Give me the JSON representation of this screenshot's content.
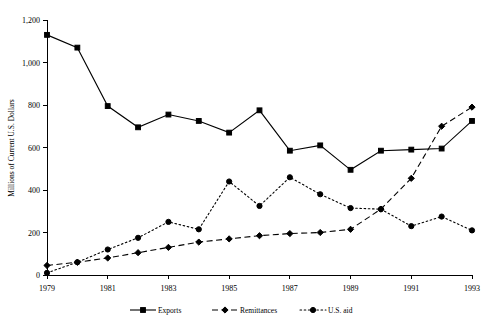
{
  "chart_data": {
    "type": "line",
    "title": "",
    "xlabel": "",
    "ylabel": "Millions of Current U.S. Dollars",
    "x": [
      1979,
      1980,
      1981,
      1982,
      1983,
      1984,
      1985,
      1986,
      1987,
      1988,
      1989,
      1990,
      1991,
      1992,
      1993
    ],
    "xtick_labels": [
      "1979",
      "1981",
      "1983",
      "1985",
      "1987",
      "1989",
      "1991",
      "1993"
    ],
    "xtick_values": [
      1979,
      1981,
      1983,
      1985,
      1987,
      1989,
      1991,
      1993
    ],
    "ytick_labels": [
      "0",
      "200",
      "400",
      "600",
      "800",
      "1,000",
      "1,200"
    ],
    "ytick_values": [
      0,
      200,
      400,
      600,
      800,
      1000,
      1200
    ],
    "xlim": [
      1979,
      1993
    ],
    "ylim": [
      0,
      1200
    ],
    "grid": false,
    "legend_position": "bottom",
    "series": [
      {
        "name": "Exports",
        "line_style": "solid",
        "marker": "square",
        "color": "#000000",
        "values": [
          1130,
          1070,
          795,
          695,
          755,
          725,
          670,
          775,
          585,
          610,
          495,
          585,
          590,
          595,
          725
        ]
      },
      {
        "name": "Remittances",
        "line_style": "dashed",
        "marker": "diamond",
        "color": "#000000",
        "values": [
          45,
          60,
          80,
          105,
          130,
          155,
          170,
          185,
          195,
          200,
          215,
          310,
          455,
          700,
          790
        ]
      },
      {
        "name": "U.S. aid",
        "line_style": "dotted",
        "marker": "circle",
        "color": "#000000",
        "values": [
          10,
          60,
          120,
          175,
          250,
          215,
          440,
          325,
          460,
          380,
          315,
          310,
          230,
          275,
          210
        ]
      }
    ]
  },
  "legend": {
    "items": [
      {
        "label": "Exports"
      },
      {
        "label": "Remittances"
      },
      {
        "label": "U.S. aid"
      }
    ]
  }
}
